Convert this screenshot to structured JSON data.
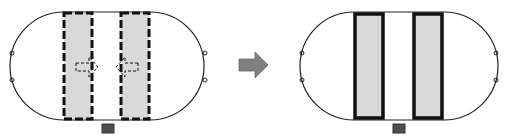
{
  "diagram": {
    "colors": {
      "fill": "#d9d9d9",
      "border": "#111111",
      "arrow": "#808080",
      "marker": "#4d4d4d",
      "outline": "#222222"
    },
    "panels": [
      {
        "id": "before",
        "rect_style": "dashed",
        "inner_arrows": [
          "right",
          "left"
        ]
      },
      {
        "id": "after",
        "rect_style": "solid",
        "inner_arrows": []
      }
    ],
    "transition_arrow": "right-arrow"
  }
}
